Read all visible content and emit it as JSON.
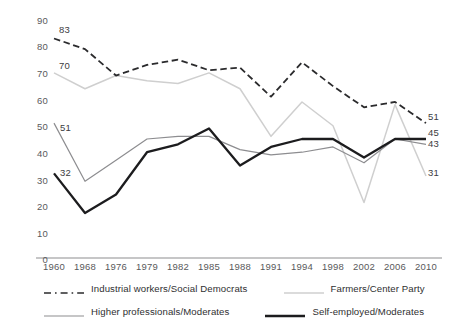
{
  "chart_data": {
    "type": "line",
    "title": "",
    "subtitle": "",
    "xlabel": "",
    "ylabel": "",
    "grid": false,
    "legend_position": "bottom",
    "categories": [
      "1960",
      "1968",
      "1976",
      "1979",
      "1982",
      "1985",
      "1988",
      "1991",
      "1994",
      "1998",
      "2002",
      "2006",
      "2010"
    ],
    "x": [
      1960,
      1968,
      1976,
      1979,
      1982,
      1985,
      1988,
      1991,
      1994,
      1998,
      2002,
      2006,
      2010
    ],
    "ylim": [
      0,
      90
    ],
    "yticks": [
      0,
      10,
      20,
      30,
      40,
      50,
      60,
      70,
      80,
      90
    ],
    "series": [
      {
        "name": "Industrial workers/Social Democrats",
        "color": "#2b2b2d",
        "style": "dashed",
        "values": [
          83,
          79,
          69,
          73,
          75,
          71,
          72,
          61,
          74,
          65,
          57,
          59,
          51
        ],
        "start_label": "83",
        "end_label": "51"
      },
      {
        "name": "Farmers/Center Party",
        "color": "#cfcfcf",
        "style": "solid",
        "values": [
          70,
          64,
          69,
          67,
          66,
          70,
          64,
          46,
          59,
          50,
          21,
          58,
          31
        ],
        "start_label": "70",
        "end_label": "31"
      },
      {
        "name": "Higher professionals/Moderates",
        "color": "#8d8d90",
        "style": "solid",
        "values": [
          51,
          29,
          37,
          45,
          46,
          46,
          41,
          39,
          40,
          42,
          36,
          45,
          43
        ],
        "start_label": "51",
        "end_label": "43"
      },
      {
        "name": "Self-employed/Moderates",
        "color": "#1c1c1e",
        "style": "solid",
        "values": [
          32,
          17,
          24,
          40,
          43,
          49,
          35,
          42,
          45,
          45,
          38,
          45,
          45
        ],
        "start_label": "32",
        "end_label": "45"
      }
    ],
    "annotations": [
      {
        "text": "83",
        "series": "Industrial workers/Social Democrats",
        "x": "1960"
      },
      {
        "text": "70",
        "series": "Farmers/Center Party",
        "x": "1960"
      },
      {
        "text": "51",
        "series": "Higher professionals/Moderates",
        "x": "1960"
      },
      {
        "text": "32",
        "series": "Self-employed/Moderates",
        "x": "1960"
      },
      {
        "text": "51",
        "series": "Industrial workers/Social Democrats",
        "x": "2010"
      },
      {
        "text": "45",
        "series": "Self-employed/Moderates",
        "x": "2010"
      },
      {
        "text": "43",
        "series": "Higher professionals/Moderates",
        "x": "2010"
      },
      {
        "text": "31",
        "series": "Farmers/Center Party",
        "x": "2010"
      }
    ]
  },
  "axis": {
    "y_labels": [
      "90",
      "80",
      "70",
      "60",
      "50",
      "40",
      "30",
      "20",
      "10",
      "0"
    ],
    "x_labels": [
      "1960",
      "1968",
      "1976",
      "1979",
      "1982",
      "1985",
      "1988",
      "1991",
      "1994",
      "1998",
      "2002",
      "2006",
      "2010"
    ],
    "baseline_color": "#8d8d90"
  },
  "legend": {
    "items": [
      {
        "label": "Industrial workers/Social Democrats",
        "color": "#2b2b2d",
        "style": "dashed"
      },
      {
        "label": "Farmers/Center Party",
        "color": "#cfcfcf",
        "style": "solid"
      },
      {
        "label": "Higher professionals/Moderates",
        "color": "#8d8d90",
        "style": "solid"
      },
      {
        "label": "Self-employed/Moderates",
        "color": "#1c1c1e",
        "style": "solid"
      }
    ]
  },
  "labels": {
    "start": {
      "industrial": "83",
      "farmers": "70",
      "professionals": "51",
      "selfemployed": "32"
    },
    "end": {
      "industrial": "51",
      "selfemployed": "45",
      "professionals": "43",
      "farmers": "31"
    }
  }
}
